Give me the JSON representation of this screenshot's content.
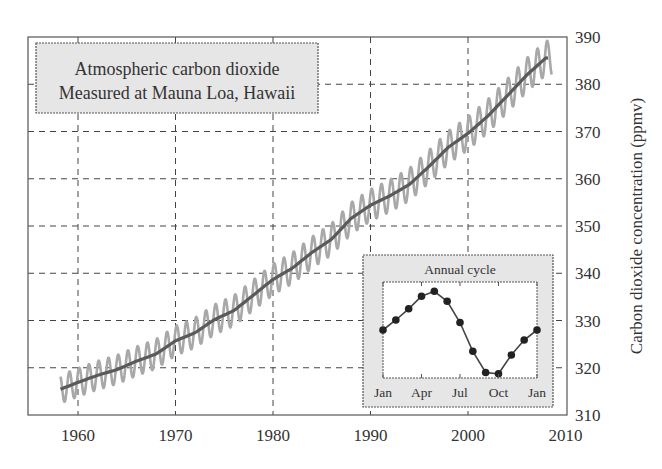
{
  "chart_data": {
    "type": "line",
    "title": "Atmospheric carbon dioxide",
    "subtitle": "Measured at Mauna Loa, Hawaii",
    "xlabel": "",
    "ylabel": "Carbon dioxide concentration (ppmv)",
    "xlim": [
      1955,
      2010
    ],
    "ylim": [
      310,
      390
    ],
    "grid": true,
    "x_ticks": [
      "1960",
      "1970",
      "1980",
      "1990",
      "2000",
      "2010"
    ],
    "y_ticks": [
      "310",
      "320",
      "330",
      "340",
      "350",
      "360",
      "370",
      "380",
      "390"
    ],
    "y_axis_position": "right",
    "series": [
      {
        "name": "Annual mean (smoothed trend)",
        "x": [
          1958,
          1960,
          1962,
          1964,
          1966,
          1968,
          1970,
          1972,
          1974,
          1976,
          1978,
          1980,
          1982,
          1984,
          1986,
          1988,
          1990,
          1992,
          1994,
          1996,
          1998,
          2000,
          2002,
          2004,
          2006,
          2008
        ],
        "values": [
          315.3,
          316.9,
          318.4,
          319.6,
          321.4,
          322.9,
          325.7,
          327.4,
          330.2,
          332.1,
          335.4,
          338.7,
          341.1,
          344.4,
          347.2,
          351.6,
          354.4,
          356.4,
          358.8,
          362.6,
          366.7,
          369.6,
          373.2,
          377.5,
          381.9,
          385.6
        ]
      },
      {
        "name": "Monthly values (with seasonal cycle)",
        "seasonal_amplitude_ppm": 3.0
      }
    ],
    "inset": {
      "title": "Annual cycle",
      "type": "line",
      "categories": [
        "Jan",
        "Feb",
        "Mar",
        "Apr",
        "May",
        "Jun",
        "Jul",
        "Aug",
        "Sep",
        "Oct",
        "Nov",
        "Dec",
        "Jan"
      ],
      "x_tick_labels": [
        "Jan",
        "Apr",
        "Jul",
        "Oct",
        "Jan"
      ],
      "values": [
        0.0,
        0.8,
        1.7,
        2.7,
        3.1,
        2.3,
        0.6,
        -1.7,
        -3.4,
        -3.5,
        -2.0,
        -0.8,
        0.0
      ]
    }
  },
  "title_box": {
    "line1": "Atmospheric carbon dioxide",
    "line2": "Measured at Mauna Loa, Hawaii"
  },
  "colors": {
    "trend": "#5a5a5a",
    "monthly": "#a8a8a8",
    "grid": "#444444",
    "box_fill": "#e6e6e6",
    "text": "#333333"
  }
}
